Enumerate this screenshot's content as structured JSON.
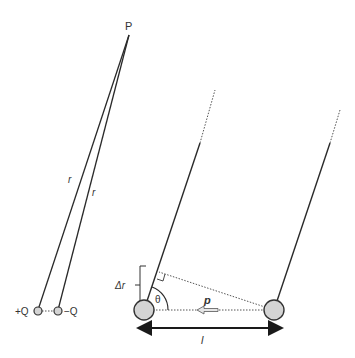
{
  "diagram": {
    "colors": {
      "line": "#2a2a2a",
      "charge_fill": "#d4d4d4",
      "charge_stroke": "#333333",
      "dotted": "#555555",
      "dipole_arrow_fill": "#e6e6e6"
    },
    "labels": {
      "point": "P",
      "r_left": "r",
      "r_right": "r",
      "plus_charge": "+Q",
      "minus_charge": "−Q",
      "delta_r": "Δr",
      "theta": "θ",
      "dipole_moment": "p",
      "separation": "l"
    }
  }
}
